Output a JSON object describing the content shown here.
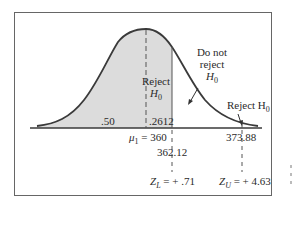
{
  "figure": {
    "type": "normal-distribution-hypothesis-test",
    "colors": {
      "curve": "#3a3a3a",
      "shade": "#dcdcdc",
      "axis": "#3a3a3a",
      "dashed": "#555555",
      "frame": "#666666"
    },
    "regions": {
      "reject_center": {
        "line1": "Reject",
        "line2": "H",
        "sub": "0"
      },
      "do_not_reject": {
        "line1": "Do not",
        "line2": "reject",
        "line3": "H",
        "sub": "0"
      },
      "reject_right": {
        "text": "Reject H",
        "sub": "0"
      }
    },
    "areas": {
      "left_half": ".50",
      "middle": ".2612"
    },
    "axis_labels": {
      "mu": "μ",
      "mu_sub": "1",
      "mu_value": " = 360",
      "lower_value": "362.12",
      "upper_value": "373.88"
    },
    "z_labels": {
      "lower": {
        "z": "Z",
        "sub": "L",
        "value": " = + .71"
      },
      "upper": {
        "z": "Z",
        "sub": "U",
        "value": " = + 4.63"
      }
    }
  }
}
